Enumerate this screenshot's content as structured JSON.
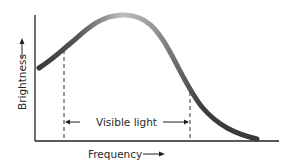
{
  "diagram": {
    "y_axis_label": "Brightness",
    "x_axis_label": "Frequency",
    "band_label": "Visible light",
    "colors": {
      "curve_dark": "#3a3a3a",
      "curve_light": "#b8b8b8",
      "axis": "#222222",
      "text": "#2a2a2a"
    }
  }
}
